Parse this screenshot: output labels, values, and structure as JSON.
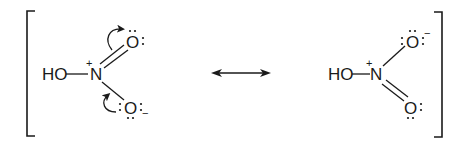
{
  "diagram": {
    "colors": {
      "ink": "#1a1a1a",
      "background": "#ffffff"
    },
    "left_structure": {
      "hydroxyl_label": "HO",
      "nitrogen_label": "N",
      "nitrogen_charge": "+",
      "top_oxygen_label": "O",
      "top_oxygen_lone_pairs": "2",
      "top_bond": "double",
      "bottom_oxygen_label": "O",
      "bottom_oxygen_lone_pairs": "3",
      "bottom_oxygen_charge": "−",
      "bottom_bond": "single",
      "curved_arrows": [
        {
          "from": "N=O pi bond",
          "to": "top oxygen"
        },
        {
          "from": "bottom oxygen lone pair",
          "to": "N–O bond"
        }
      ]
    },
    "resonance_arrow": {
      "type": "double-headed",
      "icon": "resonance-arrow-icon"
    },
    "right_structure": {
      "hydroxyl_label": "HO",
      "nitrogen_label": "N",
      "nitrogen_charge": "+",
      "top_oxygen_label": "O",
      "top_oxygen_lone_pairs": "3",
      "top_oxygen_charge": "−",
      "top_bond": "single",
      "bottom_oxygen_label": "O",
      "bottom_oxygen_lone_pairs": "2",
      "bottom_bond": "double"
    },
    "brackets": {
      "left": "[",
      "right": "]"
    }
  }
}
